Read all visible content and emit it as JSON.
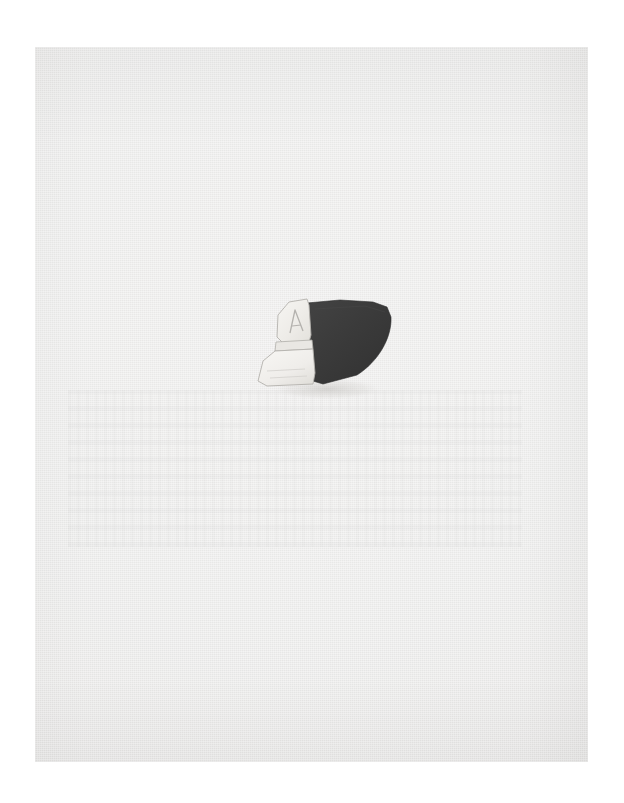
{
  "page": {
    "medium": "photographic plate on paper",
    "background_color": "#ffffff",
    "plate_color": "#ececeb",
    "plate_edge_color": "#e4e3e2",
    "caption": ""
  },
  "specimen": {
    "group_label": "pottery-sherd-group",
    "count": 3,
    "arrangement": "two pale fragments at left abutting one dark fragment at right",
    "fragments": [
      {
        "id": "fragment-upper-left",
        "label": "Upper pale sherd",
        "color": "#f0eeea",
        "tone": "light",
        "shape": "tapered trapezoid, narrow at top",
        "surface_mark": "incised A-shaped groove",
        "edge_color": "#b9b7b3"
      },
      {
        "id": "fragment-lower-left",
        "label": "Lower pale sherd",
        "color": "#f2f1ed",
        "tone": "light",
        "shape": "broad trapezoid, widening downward",
        "surface_mark": "faint horizontal striations",
        "edge_color": "#bbb9b5"
      },
      {
        "id": "fragment-right",
        "label": "Dark sherd",
        "color": "#3a3a3a",
        "tone": "dark",
        "shape": "leaf-like wedge with convex right edge and pointed lower tip",
        "surface_mark": "matte unburnished",
        "edge_color": "#2d2d2d"
      }
    ]
  },
  "colors": {
    "page": "#ffffff",
    "plate": "#ececeb",
    "dark_fragment": "#3a3a3a",
    "pale_fragment": "#f1efeb",
    "shadow": "#d2d0cd"
  }
}
